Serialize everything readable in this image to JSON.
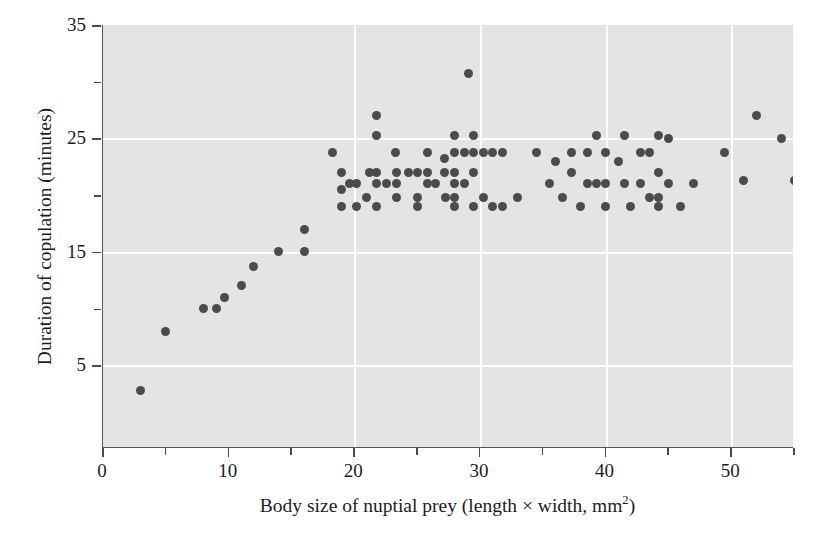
{
  "chart_data": {
    "type": "scatter",
    "title": "",
    "xlabel": "Body size of nuptial prey (length × width, mm²)",
    "xlabel_main": "Body size of nuptial prey (length × width, mm",
    "xlabel_sup": "2",
    "xlabel_tail": ")",
    "ylabel": "Duration of copulation (minutes)",
    "xlim": [
      0,
      55
    ],
    "ylim": [
      -2.3,
      35
    ],
    "xticks_major": [
      0,
      10,
      20,
      30,
      40,
      50
    ],
    "xticks_minor": [
      5,
      15,
      25,
      35,
      45,
      55
    ],
    "yticks_major": [
      5,
      15,
      25,
      35
    ],
    "yticks_minor": [
      10,
      20,
      30
    ],
    "xtick_labels": [
      "0",
      "10",
      "20",
      "30",
      "40",
      "50"
    ],
    "ytick_labels": [
      "5",
      "15",
      "25",
      "35"
    ],
    "grid": true,
    "gridlines_x": [
      20,
      30,
      40,
      50
    ],
    "gridlines_y": [
      5,
      15,
      25
    ],
    "legend": "none",
    "marker_color": "#4b4b4b",
    "panel_color": "#e4e4e4",
    "grid_color": "#ffffff",
    "axis_color": "#555555",
    "points": [
      [
        3,
        2.8
      ],
      [
        5,
        8.0
      ],
      [
        8,
        10.0
      ],
      [
        9,
        10.0
      ],
      [
        9.7,
        11.0
      ],
      [
        11,
        12.0
      ],
      [
        12,
        13.7
      ],
      [
        14,
        15.0
      ],
      [
        16,
        15.0
      ],
      [
        16,
        17.0
      ],
      [
        18.3,
        23.8
      ],
      [
        19.0,
        22.0
      ],
      [
        19.0,
        20.5
      ],
      [
        19.0,
        19.0
      ],
      [
        19.6,
        21.0
      ],
      [
        20.2,
        21.0
      ],
      [
        20.2,
        19.0
      ],
      [
        21.0,
        19.8
      ],
      [
        21.2,
        22.0
      ],
      [
        21.8,
        27.0
      ],
      [
        21.8,
        25.3
      ],
      [
        21.8,
        22.0
      ],
      [
        21.8,
        21.0
      ],
      [
        21.8,
        19.0
      ],
      [
        22.6,
        21.0
      ],
      [
        23.3,
        23.8
      ],
      [
        23.4,
        22.0
      ],
      [
        23.4,
        21.0
      ],
      [
        23.4,
        19.8
      ],
      [
        24.3,
        22.0
      ],
      [
        25.0,
        22.0
      ],
      [
        25.0,
        19.8
      ],
      [
        25.0,
        19.0
      ],
      [
        25.8,
        23.8
      ],
      [
        25.8,
        22.0
      ],
      [
        25.8,
        21.0
      ],
      [
        26.5,
        21.0
      ],
      [
        27.2,
        23.2
      ],
      [
        27.2,
        22.0
      ],
      [
        27.3,
        19.8
      ],
      [
        28.0,
        25.3
      ],
      [
        28.0,
        23.8
      ],
      [
        28.0,
        22.0
      ],
      [
        28.0,
        21.0
      ],
      [
        28.0,
        19.8
      ],
      [
        28.0,
        19.0
      ],
      [
        29.1,
        30.7
      ],
      [
        28.8,
        23.8
      ],
      [
        28.8,
        21.0
      ],
      [
        29.5,
        25.3
      ],
      [
        29.5,
        23.8
      ],
      [
        29.5,
        22.0
      ],
      [
        29.5,
        19.0
      ],
      [
        30.3,
        23.8
      ],
      [
        30.3,
        19.8
      ],
      [
        31.0,
        23.8
      ],
      [
        31.0,
        19.0
      ],
      [
        31.8,
        23.8
      ],
      [
        31.8,
        19.0
      ],
      [
        33.0,
        19.8
      ],
      [
        34.5,
        23.8
      ],
      [
        35.5,
        21.0
      ],
      [
        36.0,
        23.0
      ],
      [
        36.6,
        19.8
      ],
      [
        37.3,
        23.8
      ],
      [
        37.3,
        22.0
      ],
      [
        38.0,
        19.0
      ],
      [
        38.6,
        23.8
      ],
      [
        38.6,
        21.0
      ],
      [
        39.3,
        25.3
      ],
      [
        39.3,
        21.0
      ],
      [
        40.0,
        23.8
      ],
      [
        40.0,
        21.0
      ],
      [
        40.0,
        19.0
      ],
      [
        41.0,
        23.0
      ],
      [
        41.5,
        25.3
      ],
      [
        41.5,
        21.0
      ],
      [
        42.0,
        19.0
      ],
      [
        42.8,
        23.8
      ],
      [
        42.8,
        21.0
      ],
      [
        43.5,
        23.8
      ],
      [
        43.5,
        19.8
      ],
      [
        44.2,
        25.3
      ],
      [
        44.2,
        22.0
      ],
      [
        44.2,
        19.8
      ],
      [
        44.2,
        19.0
      ],
      [
        45.0,
        25.0
      ],
      [
        45.0,
        21.0
      ],
      [
        46.0,
        19.0
      ],
      [
        47.0,
        21.0
      ],
      [
        49.5,
        23.8
      ],
      [
        51.0,
        21.3
      ],
      [
        52.0,
        27.0
      ],
      [
        54.0,
        25.0
      ],
      [
        55.0,
        21.3
      ]
    ]
  }
}
